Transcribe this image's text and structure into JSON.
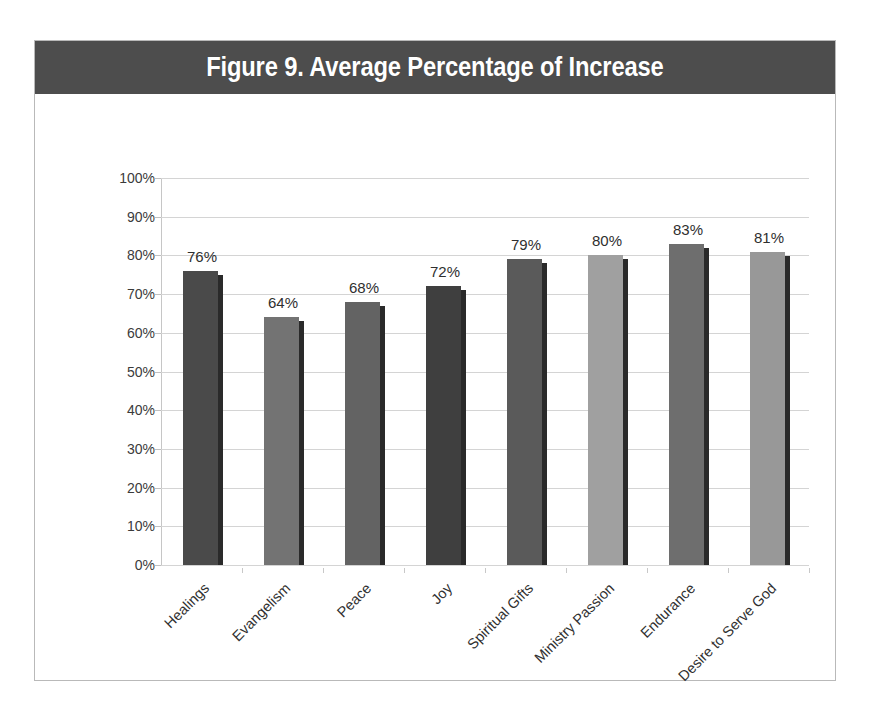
{
  "figure": {
    "title": "Figure 9. Average Percentage of Increase",
    "title_band_color": "#4d4d4d",
    "frame_border_color": "#b9b9b9",
    "background_color": "#ffffff"
  },
  "chart_data": {
    "type": "bar",
    "title": "Figure 9. Average Percentage of Increase",
    "xlabel": "",
    "ylabel": "",
    "ylim": [
      0,
      100
    ],
    "ytick_labels": [
      "100%",
      "90%",
      "80%",
      "70%",
      "60%",
      "50%",
      "40%",
      "30%",
      "20%",
      "10%",
      "0%"
    ],
    "ytick_values": [
      100,
      90,
      80,
      70,
      60,
      50,
      40,
      30,
      20,
      10,
      0
    ],
    "grid": true,
    "legend": "none",
    "value_label_suffix": "%",
    "categories": [
      "Healings",
      "Evangelism",
      "Peace",
      "Joy",
      "Spiritual Gifts",
      "Ministry Passion",
      "Endurance",
      "Desire to Serve God"
    ],
    "values": [
      76,
      64,
      68,
      72,
      79,
      80,
      83,
      81
    ],
    "value_labels": [
      "76%",
      "64%",
      "68%",
      "72%",
      "79%",
      "80%",
      "83%",
      "81%"
    ],
    "bar_colors": [
      "#4a4a4a",
      "#737373",
      "#636363",
      "#3f3f3f",
      "#5a5a5a",
      "#a0a0a0",
      "#6e6e6e",
      "#989898"
    ],
    "bar_shadow_color": "#2a2a2a",
    "gridline_color": "#d4d4d4",
    "axis_color": "#c6c6c6"
  }
}
